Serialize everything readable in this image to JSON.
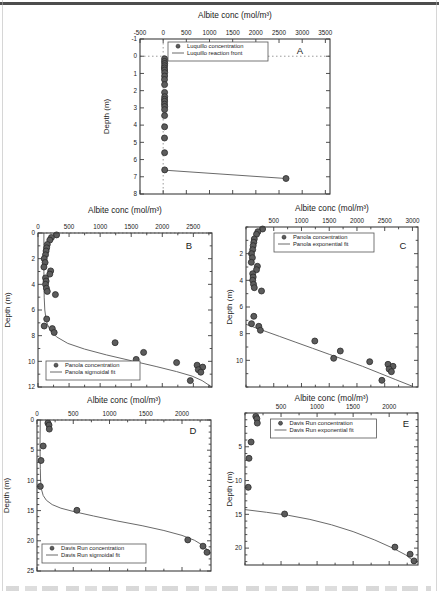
{
  "page": {
    "background": "#ffffff",
    "top_bar_color": "#4d4d4d"
  },
  "style": {
    "marker_fill": "#5c5c5c",
    "marker_edge": "#2b2b2b",
    "fit_line_color": "#6a6a6a",
    "frame_color": "#3c3c3c",
    "dotted_line_color": "#909090",
    "text_color": "#1a1a1a",
    "legend_border": "#555555"
  },
  "chart_data": [
    {
      "id": "A",
      "type": "scatter",
      "panel_label": "A",
      "title": "Albite conc (mol/m³)",
      "ylabel": "Depth (m)",
      "xlim": [
        -500,
        3600
      ],
      "ylim": [
        -1,
        8
      ],
      "xticks": [
        -500,
        0,
        500,
        1000,
        1500,
        2000,
        2500,
        3000,
        3500
      ],
      "yticks": [
        -1,
        0,
        1,
        2,
        3,
        4,
        5,
        6,
        7,
        8
      ],
      "x_minor_step": null,
      "y_minor_step": null,
      "grid": false,
      "x_axis_position": "top",
      "dotted_h_y": 0,
      "dotted_v_x": 0,
      "legend": {
        "position": "top-center",
        "items": [
          {
            "marker": "dot",
            "label": "Luquillo concentration"
          },
          {
            "marker": "line",
            "label": "Luquillo reaction front"
          }
        ]
      },
      "series": [
        {
          "name": "Luquillo concentration",
          "type": "scatter",
          "points": [
            [
              30,
              0.15
            ],
            [
              28,
              0.3
            ],
            [
              33,
              0.42
            ],
            [
              30,
              0.55
            ],
            [
              27,
              0.68
            ],
            [
              31,
              0.8
            ],
            [
              34,
              0.95
            ],
            [
              30,
              1.15
            ],
            [
              28,
              1.35
            ],
            [
              31,
              1.65
            ],
            [
              30,
              2.1
            ],
            [
              33,
              2.35
            ],
            [
              28,
              2.5
            ],
            [
              31,
              2.62
            ],
            [
              29,
              2.78
            ],
            [
              32,
              2.92
            ],
            [
              30,
              3.1
            ],
            [
              30,
              3.45
            ],
            [
              31,
              4.1
            ],
            [
              29,
              4.75
            ],
            [
              30,
              5.6
            ],
            [
              32,
              6.6
            ],
            [
              2650,
              7.1
            ]
          ]
        },
        {
          "name": "Luquillo reaction front",
          "type": "line",
          "points": [
            [
              32,
              6.62
            ],
            [
              2650,
              7.1
            ]
          ]
        }
      ]
    },
    {
      "id": "B",
      "type": "scatter",
      "panel_label": "B",
      "title": "Albite conc (mol/m³)",
      "ylabel": "Depth (m)",
      "xlim": [
        0,
        2800
      ],
      "ylim": [
        0,
        12
      ],
      "xticks": [
        0,
        500,
        1000,
        1500,
        2000,
        2500
      ],
      "yticks": [
        0,
        2,
        4,
        6,
        8,
        10,
        12
      ],
      "x_minor_step": 250,
      "y_minor_step": 1,
      "grid": false,
      "x_axis_position": "top",
      "dotted_h_y": 0,
      "dotted_v_x": null,
      "legend": {
        "position": "bottom-left",
        "items": [
          {
            "marker": "dot",
            "label": "Panola concentration"
          },
          {
            "marker": "line",
            "label": "Panola sigmoidal fit"
          }
        ]
      },
      "series": [
        {
          "name": "Panola concentration",
          "type": "scatter",
          "points": [
            [
              300,
              0.15
            ],
            [
              215,
              0.35
            ],
            [
              190,
              0.55
            ],
            [
              150,
              0.9
            ],
            [
              140,
              1.15
            ],
            [
              130,
              1.4
            ],
            [
              120,
              1.7
            ],
            [
              100,
              2.0
            ],
            [
              115,
              2.3
            ],
            [
              95,
              2.65
            ],
            [
              205,
              2.95
            ],
            [
              190,
              3.2
            ],
            [
              120,
              3.5
            ],
            [
              130,
              3.75
            ],
            [
              120,
              4.0
            ],
            [
              135,
              4.3
            ],
            [
              150,
              4.55
            ],
            [
              280,
              4.8
            ],
            [
              140,
              6.7
            ],
            [
              100,
              7.25
            ],
            [
              230,
              7.45
            ],
            [
              260,
              7.75
            ],
            [
              1240,
              8.55
            ],
            [
              1700,
              9.3
            ],
            [
              1580,
              9.85
            ],
            [
              2230,
              10.1
            ],
            [
              2560,
              10.3
            ],
            [
              2650,
              10.45
            ],
            [
              2580,
              10.65
            ],
            [
              2620,
              10.85
            ],
            [
              2450,
              11.5
            ]
          ]
        },
        {
          "name": "Panola sigmoidal fit",
          "type": "line",
          "points": [
            [
              95,
              0
            ],
            [
              95,
              3
            ],
            [
              100,
              5
            ],
            [
              110,
              6
            ],
            [
              125,
              6.6
            ],
            [
              150,
              7.1
            ],
            [
              200,
              7.6
            ],
            [
              300,
              8.1
            ],
            [
              480,
              8.6
            ],
            [
              750,
              9.05
            ],
            [
              1100,
              9.5
            ],
            [
              1500,
              9.95
            ],
            [
              1900,
              10.4
            ],
            [
              2230,
              10.8
            ],
            [
              2480,
              11.15
            ],
            [
              2640,
              11.5
            ],
            [
              2750,
              11.85
            ],
            [
              2800,
              12
            ]
          ]
        }
      ]
    },
    {
      "id": "C",
      "type": "scatter",
      "panel_label": "C",
      "title": "Albite conc (mol/m³)",
      "ylabel": "Depth (m)",
      "xlim": [
        0,
        3100
      ],
      "ylim": [
        0,
        12
      ],
      "xticks": [
        500,
        1000,
        1500,
        2000,
        2500,
        3000
      ],
      "yticks": [
        2,
        4,
        6,
        8,
        10
      ],
      "x_minor_step": 250,
      "y_minor_step": 1,
      "grid": false,
      "x_axis_position": "top",
      "dotted_h_y": null,
      "dotted_v_x": null,
      "legend": {
        "position": "top-center",
        "items": [
          {
            "marker": "dot",
            "label": "Panola concentration"
          },
          {
            "marker": "line",
            "label": "Panola exponential fit"
          }
        ]
      },
      "series": [
        {
          "name": "Panola concentration",
          "type": "scatter",
          "points": [
            [
              300,
              0.15
            ],
            [
              215,
              0.35
            ],
            [
              190,
              0.55
            ],
            [
              150,
              0.9
            ],
            [
              140,
              1.15
            ],
            [
              130,
              1.4
            ],
            [
              120,
              1.7
            ],
            [
              100,
              2.0
            ],
            [
              115,
              2.3
            ],
            [
              95,
              2.65
            ],
            [
              205,
              2.95
            ],
            [
              190,
              3.2
            ],
            [
              120,
              3.5
            ],
            [
              130,
              3.75
            ],
            [
              120,
              4.0
            ],
            [
              135,
              4.3
            ],
            [
              150,
              4.55
            ],
            [
              280,
              4.8
            ],
            [
              140,
              6.7
            ],
            [
              100,
              7.25
            ],
            [
              230,
              7.45
            ],
            [
              260,
              7.75
            ],
            [
              1240,
              8.55
            ],
            [
              1700,
              9.3
            ],
            [
              1580,
              9.85
            ],
            [
              2230,
              10.1
            ],
            [
              2560,
              10.3
            ],
            [
              2650,
              10.45
            ],
            [
              2580,
              10.65
            ],
            [
              2620,
              10.85
            ],
            [
              2450,
              11.5
            ]
          ]
        },
        {
          "name": "Panola exponential fit",
          "type": "line",
          "points": [
            [
              0,
              7.3
            ],
            [
              300,
              7.75
            ],
            [
              600,
              8.2
            ],
            [
              900,
              8.65
            ],
            [
              1200,
              9.1
            ],
            [
              1500,
              9.55
            ],
            [
              1800,
              10.0
            ],
            [
              2100,
              10.45
            ],
            [
              2400,
              10.95
            ],
            [
              2700,
              11.45
            ],
            [
              3000,
              11.95
            ]
          ]
        }
      ]
    },
    {
      "id": "D",
      "type": "scatter",
      "panel_label": "D",
      "title": "Albite conc (mol/m³)",
      "ylabel": "Depth (m)",
      "xlim": [
        0,
        2400
      ],
      "ylim": [
        0,
        25
      ],
      "xticks": [
        0,
        500,
        1000,
        1500,
        2000
      ],
      "yticks": [
        0,
        5,
        10,
        15,
        20,
        25
      ],
      "x_minor_step": 250,
      "y_minor_step": 1,
      "grid": false,
      "x_axis_position": "top",
      "dotted_h_y": 0,
      "dotted_v_x": null,
      "legend": {
        "position": "bottom-left",
        "items": [
          {
            "marker": "dot",
            "label": "Davis Run concentration"
          },
          {
            "marker": "line",
            "label": "Davis Run sigmoidal fit"
          }
        ]
      },
      "series": [
        {
          "name": "Davis Run concentration",
          "type": "scatter",
          "points": [
            [
              150,
              0.5
            ],
            [
              165,
              0.85
            ],
            [
              170,
              1.5
            ],
            [
              85,
              4.3
            ],
            [
              55,
              6.7
            ],
            [
              45,
              11.0
            ],
            [
              550,
              14.95
            ],
            [
              2080,
              19.85
            ],
            [
              2290,
              20.9
            ],
            [
              2345,
              21.9
            ]
          ]
        },
        {
          "name": "Davis Run sigmoidal fit",
          "type": "line",
          "points": [
            [
              45,
              0
            ],
            [
              42,
              4
            ],
            [
              45,
              8
            ],
            [
              50,
              10
            ],
            [
              62,
              11.5
            ],
            [
              85,
              12.5
            ],
            [
              130,
              13.3
            ],
            [
              210,
              14.0
            ],
            [
              330,
              14.6
            ],
            [
              520,
              15.2
            ],
            [
              780,
              15.9
            ],
            [
              1100,
              16.7
            ],
            [
              1450,
              17.5
            ],
            [
              1750,
              18.3
            ],
            [
              2000,
              19.1
            ],
            [
              2170,
              19.9
            ],
            [
              2280,
              20.7
            ],
            [
              2345,
              21.4
            ],
            [
              2380,
              22.1
            ]
          ]
        }
      ]
    },
    {
      "id": "E",
      "type": "scatter",
      "panel_label": "E",
      "title": "Albite conc (mol/m³)",
      "ylabel": "Depth (m)",
      "xlim": [
        0,
        2400
      ],
      "ylim": [
        0,
        22.5
      ],
      "xticks": [
        500,
        1000,
        1500,
        2000
      ],
      "yticks": [
        5,
        10,
        15,
        20
      ],
      "x_minor_step": 250,
      "y_minor_step": 1,
      "grid": false,
      "x_axis_position": "top",
      "dotted_h_y": null,
      "dotted_v_x": null,
      "legend": {
        "position": "top-center",
        "items": [
          {
            "marker": "dot",
            "label": "Davis Run concentration"
          },
          {
            "marker": "line",
            "label": "Davis Run exponential fit"
          }
        ]
      },
      "series": [
        {
          "name": "Davis Run concentration",
          "type": "scatter",
          "points": [
            [
              150,
              0.5
            ],
            [
              165,
              0.85
            ],
            [
              170,
              1.5
            ],
            [
              85,
              4.3
            ],
            [
              55,
              6.7
            ],
            [
              45,
              11.0
            ],
            [
              550,
              14.95
            ],
            [
              2080,
              19.85
            ],
            [
              2290,
              20.9
            ],
            [
              2345,
              21.9
            ]
          ]
        },
        {
          "name": "Davis Run exponential fit",
          "type": "line",
          "points": [
            [
              0,
              14.3
            ],
            [
              300,
              14.7
            ],
            [
              600,
              15.15
            ],
            [
              900,
              15.75
            ],
            [
              1200,
              16.55
            ],
            [
              1500,
              17.55
            ],
            [
              1800,
              18.8
            ],
            [
              2050,
              20.0
            ],
            [
              2230,
              21.0
            ],
            [
              2360,
              22.1
            ]
          ]
        }
      ]
    }
  ]
}
